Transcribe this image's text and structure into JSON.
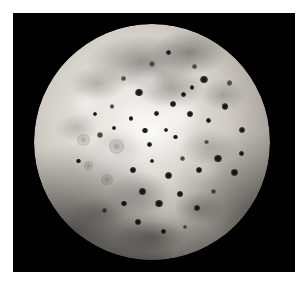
{
  "image": {
    "subject": "Io",
    "subject_type": "planetary-body",
    "description": "Grayscale spacecraft image of Jupiter's volcanic moon Io, full disk centered on a black sky background, framed by a white photographic border.",
    "orientation": "portrait",
    "palette": {
      "background": "#ffffff",
      "sky": "#000000",
      "surface_bright": "#f2f0ec",
      "surface_mid": "#b6b2ab",
      "surface_dark": "#6e6c67",
      "caldera_dark": "#0d0d0c"
    },
    "frame": {
      "border_color": "#ffffff",
      "field_left": 13,
      "field_top": 13,
      "field_width": 282,
      "field_height": 259
    },
    "disk": {
      "center_x": 152,
      "center_y": 142,
      "radius": 118,
      "limb_darkening": true,
      "illumination": "near-full"
    },
    "features": {
      "bright_region_label": "equatorial bright sulfur-dioxide plume deposits",
      "dark_region_label": "mottled grey volcanic plains",
      "spot_label": "dark volcanic caldera",
      "spots": [
        {
          "cx": 72.0,
          "cy": 23.5,
          "r": 1.6,
          "kind": "dark"
        },
        {
          "cx": 63.5,
          "cy": 30.0,
          "r": 1.1,
          "kind": "dark"
        },
        {
          "cx": 50.0,
          "cy": 17.0,
          "r": 1.3,
          "kind": "soft"
        },
        {
          "cx": 57.0,
          "cy": 12.0,
          "r": 1.0,
          "kind": "dark"
        },
        {
          "cx": 44.5,
          "cy": 29.0,
          "r": 1.5,
          "kind": "dark"
        },
        {
          "cx": 38.0,
          "cy": 23.0,
          "r": 1.1,
          "kind": "soft"
        },
        {
          "cx": 81.0,
          "cy": 35.0,
          "r": 1.4,
          "kind": "dark"
        },
        {
          "cx": 88.0,
          "cy": 45.0,
          "r": 1.3,
          "kind": "dark"
        },
        {
          "cx": 74.0,
          "cy": 41.0,
          "r": 1.0,
          "kind": "dark"
        },
        {
          "cx": 66.0,
          "cy": 38.0,
          "r": 1.2,
          "kind": "dark"
        },
        {
          "cx": 59.0,
          "cy": 34.0,
          "r": 1.3,
          "kind": "dark"
        },
        {
          "cx": 52.0,
          "cy": 38.0,
          "r": 1.0,
          "kind": "dark"
        },
        {
          "cx": 47.0,
          "cy": 45.0,
          "r": 1.1,
          "kind": "dark"
        },
        {
          "cx": 41.0,
          "cy": 40.0,
          "r": 0.9,
          "kind": "dark"
        },
        {
          "cx": 33.0,
          "cy": 35.0,
          "r": 1.0,
          "kind": "soft"
        },
        {
          "cx": 28.0,
          "cy": 47.0,
          "r": 1.4,
          "kind": "soft"
        },
        {
          "cx": 21.0,
          "cy": 49.0,
          "r": 2.6,
          "kind": "ring"
        },
        {
          "cx": 35.0,
          "cy": 52.0,
          "r": 3.2,
          "kind": "ring"
        },
        {
          "cx": 23.0,
          "cy": 60.0,
          "r": 2.0,
          "kind": "ring"
        },
        {
          "cx": 31.0,
          "cy": 66.0,
          "r": 2.4,
          "kind": "ring"
        },
        {
          "cx": 42.0,
          "cy": 62.0,
          "r": 1.2,
          "kind": "dark"
        },
        {
          "cx": 50.0,
          "cy": 58.0,
          "r": 1.0,
          "kind": "dark"
        },
        {
          "cx": 57.0,
          "cy": 64.0,
          "r": 1.5,
          "kind": "dark"
        },
        {
          "cx": 63.0,
          "cy": 57.0,
          "r": 1.1,
          "kind": "soft"
        },
        {
          "cx": 70.0,
          "cy": 62.0,
          "r": 1.3,
          "kind": "dark"
        },
        {
          "cx": 78.0,
          "cy": 57.0,
          "r": 1.6,
          "kind": "dark"
        },
        {
          "cx": 85.0,
          "cy": 63.0,
          "r": 1.4,
          "kind": "dark"
        },
        {
          "cx": 88.0,
          "cy": 55.0,
          "r": 1.0,
          "kind": "dark"
        },
        {
          "cx": 73.0,
          "cy": 50.0,
          "r": 1.0,
          "kind": "soft"
        },
        {
          "cx": 60.0,
          "cy": 48.0,
          "r": 0.9,
          "kind": "dark"
        },
        {
          "cx": 46.0,
          "cy": 71.0,
          "r": 1.3,
          "kind": "dark"
        },
        {
          "cx": 53.0,
          "cy": 76.0,
          "r": 1.6,
          "kind": "dark"
        },
        {
          "cx": 62.0,
          "cy": 72.0,
          "r": 1.2,
          "kind": "dark"
        },
        {
          "cx": 69.0,
          "cy": 78.0,
          "r": 1.4,
          "kind": "dark"
        },
        {
          "cx": 76.0,
          "cy": 71.0,
          "r": 1.1,
          "kind": "soft"
        },
        {
          "cx": 38.0,
          "cy": 76.0,
          "r": 1.2,
          "kind": "dark"
        },
        {
          "cx": 30.0,
          "cy": 79.0,
          "r": 1.0,
          "kind": "soft"
        },
        {
          "cx": 44.0,
          "cy": 84.0,
          "r": 1.3,
          "kind": "dark"
        },
        {
          "cx": 55.0,
          "cy": 88.0,
          "r": 1.1,
          "kind": "dark"
        },
        {
          "cx": 64.0,
          "cy": 86.0,
          "r": 1.0,
          "kind": "soft"
        },
        {
          "cx": 49.0,
          "cy": 51.0,
          "r": 1.0,
          "kind": "dark"
        },
        {
          "cx": 56.0,
          "cy": 45.0,
          "r": 0.9,
          "kind": "dark"
        },
        {
          "cx": 67.0,
          "cy": 27.0,
          "r": 1.0,
          "kind": "dark"
        },
        {
          "cx": 83.0,
          "cy": 25.0,
          "r": 1.1,
          "kind": "soft"
        },
        {
          "cx": 26.0,
          "cy": 38.0,
          "r": 0.9,
          "kind": "dark"
        },
        {
          "cx": 19.0,
          "cy": 58.0,
          "r": 1.0,
          "kind": "dark"
        },
        {
          "cx": 34.0,
          "cy": 44.0,
          "r": 0.8,
          "kind": "dark"
        },
        {
          "cx": 68.0,
          "cy": 18.0,
          "r": 0.9,
          "kind": "soft"
        }
      ]
    }
  }
}
